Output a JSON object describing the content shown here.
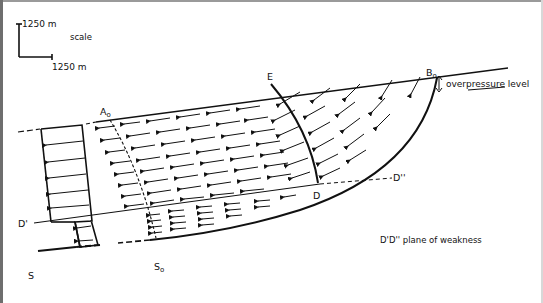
{
  "scale": {
    "vertical_label": "1250 m",
    "horizontal_label": "1250 m",
    "title": "scale"
  },
  "labels": {
    "Ao": "A",
    "Ao_sub": "o",
    "Bo": "B",
    "Bo_sub": "o",
    "So": "S",
    "So_sub": "o",
    "E": "E",
    "D": "D",
    "D_prime": "D'",
    "D_double_prime": "D''",
    "S": "S"
  },
  "annotations": {
    "overpressure": "overpressure level",
    "weakness": "D'D'' plane of weakness"
  },
  "colors": {
    "ink": "#111111",
    "background": "#ffffff"
  }
}
